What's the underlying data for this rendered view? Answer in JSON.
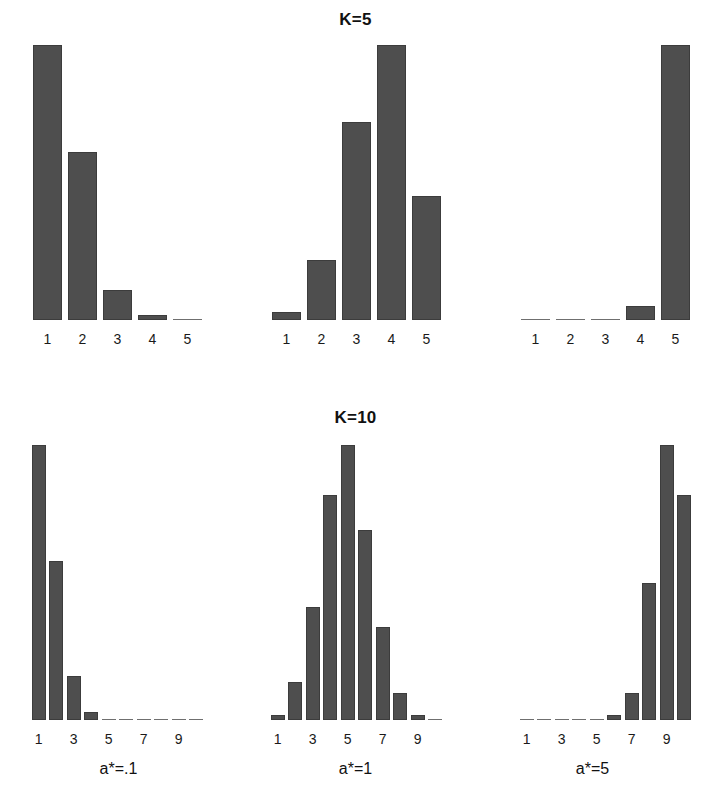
{
  "figure": {
    "background": "#ffffff",
    "bar_color": "#4e4e4e",
    "bar_edge_color": "#3c3c3c",
    "column_captions": [
      "a*=.1",
      "a*=1",
      "a*=5"
    ]
  },
  "rows": [
    {
      "title": "K=5"
    },
    {
      "title": "K=10"
    }
  ],
  "chart_data": [
    {
      "type": "bar",
      "title": "K=5",
      "panel_caption": "a*=.1",
      "row": "K=5",
      "column": 0,
      "categories": [
        "1",
        "2",
        "3",
        "4",
        "5"
      ],
      "tick_labels": [
        "1",
        "2",
        "3",
        "4",
        "5"
      ],
      "values": [
        100,
        61,
        11,
        2,
        0.5
      ],
      "xlabel": "",
      "ylabel": "",
      "ylim": [
        0,
        100
      ],
      "grid": false,
      "legend": "none"
    },
    {
      "type": "bar",
      "title": "K=5",
      "panel_caption": "a*=1",
      "row": "K=5",
      "column": 1,
      "categories": [
        "1",
        "2",
        "3",
        "4",
        "5"
      ],
      "tick_labels": [
        "1",
        "2",
        "3",
        "4",
        "5"
      ],
      "values": [
        3,
        22,
        72,
        100,
        45
      ],
      "xlabel": "",
      "ylabel": "",
      "ylim": [
        0,
        100
      ],
      "grid": false,
      "legend": "none"
    },
    {
      "type": "bar",
      "title": "K=5",
      "panel_caption": "a*=5",
      "row": "K=5",
      "column": 2,
      "categories": [
        "1",
        "2",
        "3",
        "4",
        "5"
      ],
      "tick_labels": [
        "1",
        "2",
        "3",
        "4",
        "5"
      ],
      "values": [
        0.5,
        0.5,
        0.5,
        5,
        100
      ],
      "xlabel": "",
      "ylabel": "",
      "ylim": [
        0,
        100
      ],
      "grid": false,
      "legend": "none"
    },
    {
      "type": "bar",
      "title": "K=10",
      "panel_caption": "a*=.1",
      "row": "K=10",
      "column": 0,
      "categories": [
        "1",
        "2",
        "3",
        "4",
        "5",
        "6",
        "7",
        "8",
        "9",
        "10"
      ],
      "tick_labels": [
        "1",
        "",
        "3",
        "",
        "5",
        "",
        "7",
        "",
        "9",
        ""
      ],
      "values": [
        100,
        58,
        16,
        3,
        0.5,
        0.5,
        0.5,
        0.5,
        0.5,
        0.5
      ],
      "xlabel": "",
      "ylabel": "",
      "ylim": [
        0,
        100
      ],
      "grid": false,
      "legend": "none"
    },
    {
      "type": "bar",
      "title": "K=10",
      "panel_caption": "a*=1",
      "row": "K=10",
      "column": 1,
      "categories": [
        "1",
        "2",
        "3",
        "4",
        "5",
        "6",
        "7",
        "8",
        "9",
        "10"
      ],
      "tick_labels": [
        "1",
        "",
        "3",
        "",
        "5",
        "",
        "7",
        "",
        "9",
        ""
      ],
      "values": [
        2,
        14,
        41,
        82,
        100,
        69,
        34,
        10,
        2,
        0.5
      ],
      "xlabel": "",
      "ylabel": "",
      "ylim": [
        0,
        100
      ],
      "grid": false,
      "legend": "none"
    },
    {
      "type": "bar",
      "title": "K=10",
      "panel_caption": "a*=5",
      "row": "K=10",
      "column": 2,
      "categories": [
        "1",
        "2",
        "3",
        "4",
        "5",
        "6",
        "7",
        "8",
        "9",
        "10"
      ],
      "tick_labels": [
        "1",
        "",
        "3",
        "",
        "5",
        "",
        "7",
        "",
        "9",
        ""
      ],
      "values": [
        0.5,
        0.5,
        0.5,
        0.5,
        1,
        2,
        10,
        50,
        100,
        82
      ],
      "xlabel": "",
      "ylabel": "",
      "ylim": [
        0,
        100
      ],
      "grid": false,
      "legend": "none"
    }
  ]
}
